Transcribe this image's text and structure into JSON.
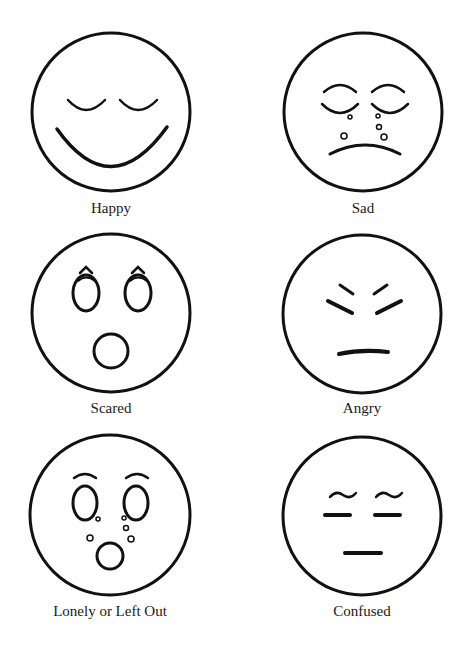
{
  "page": {
    "ink_color": "#111111",
    "background": "#ffffff"
  },
  "faces": [
    {
      "id": "happy",
      "label": "Happy",
      "icon": "happy-face-icon",
      "features": [
        "closed-eyes",
        "wide-smile"
      ]
    },
    {
      "id": "sad",
      "label": "Sad",
      "icon": "sad-face-icon",
      "features": [
        "closed-eyes",
        "tears",
        "frown"
      ]
    },
    {
      "id": "scared",
      "label": "Scared",
      "icon": "scared-face-icon",
      "features": [
        "raised-brows",
        "wide-eyes",
        "open-mouth"
      ]
    },
    {
      "id": "angry",
      "label": "Angry",
      "icon": "angry-face-icon",
      "features": [
        "slanted-brows",
        "squinting-eyes",
        "flat-mouth"
      ]
    },
    {
      "id": "lonely",
      "label": "Lonely or Left Out",
      "icon": "lonely-face-icon",
      "features": [
        "brows",
        "wide-eyes",
        "tears",
        "open-mouth"
      ]
    },
    {
      "id": "confused",
      "label": "Confused",
      "icon": "confused-face-icon",
      "features": [
        "wavy-brows",
        "flat-eyes",
        "flat-mouth"
      ]
    }
  ]
}
